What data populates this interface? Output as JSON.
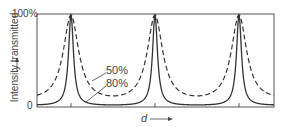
{
  "chart_data": {
    "type": "line",
    "title": "",
    "xlabel": "d",
    "ylabel": "Intensity transmitted",
    "y_ticks": [
      "0",
      "100%"
    ],
    "ylim": [
      0,
      100
    ],
    "grid": false,
    "x": [
      0,
      0.25,
      0.5,
      0.75,
      1.0,
      1.25,
      1.5,
      1.75,
      2.0,
      2.25,
      2.5,
      2.75,
      3.0,
      3.25,
      3.5
    ],
    "series": [
      {
        "name": "50%",
        "style": "dashed",
        "reflectance": 0.5,
        "values": [
          18,
          30,
          100,
          30,
          11,
          30,
          100,
          30,
          11,
          30,
          100,
          30,
          11,
          30,
          18
        ]
      },
      {
        "name": "80%",
        "style": "solid",
        "reflectance": 0.8,
        "values": [
          2,
          5,
          100,
          5,
          1,
          5,
          100,
          5,
          1,
          5,
          100,
          5,
          1,
          5,
          2
        ]
      }
    ],
    "peak_positions_px": [
      71,
      155,
      239
    ],
    "annotations": [
      "50%",
      "80%"
    ],
    "legend_position": "inline annotations with arrows"
  },
  "labels": {
    "y_top": "100%",
    "y_bottom": "0",
    "y_axis": "Intensity transmitted",
    "x_axis": "d",
    "curve_50": "50%",
    "curve_80": "80%"
  }
}
